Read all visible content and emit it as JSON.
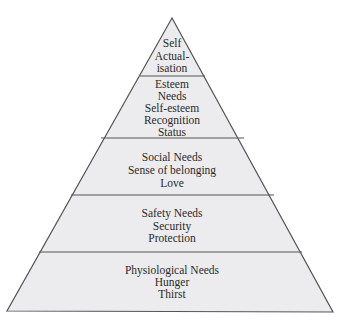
{
  "diagram": {
    "type": "pyramid",
    "colors": {
      "fill": "#ececee",
      "stroke": "#555555",
      "text": "#2a2a2a",
      "background": "#ffffff"
    },
    "levels": [
      {
        "name": "self-actualisation",
        "lines": [
          "Self",
          "Actual-",
          "isation"
        ]
      },
      {
        "name": "esteem",
        "lines": [
          "Esteem",
          "Needs",
          "Self-esteem",
          "Recognition",
          "Status"
        ]
      },
      {
        "name": "social",
        "lines": [
          "Social Needs",
          "Sense of belonging",
          "Love"
        ]
      },
      {
        "name": "safety",
        "lines": [
          "Safety Needs",
          "Security",
          "Protection"
        ]
      },
      {
        "name": "physiological",
        "lines": [
          "Physiological Needs",
          "Hunger",
          "Thirst"
        ]
      }
    ]
  }
}
